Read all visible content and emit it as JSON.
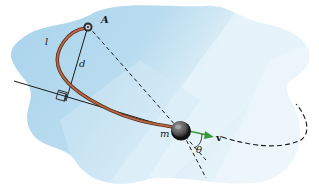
{
  "diagram": {
    "type": "physics-illustration",
    "labels": {
      "pivot": "A",
      "cord_length": "l",
      "perpendicular_distance": "d",
      "mass": "m",
      "velocity": "v",
      "angle": "θ"
    },
    "colors": {
      "surface_light": "#e3f1f8",
      "surface_mid": "#b9dcef",
      "surface_dark": "#8ec5e4",
      "cord": "#8b4a32",
      "velocity_arrow": "#3a9a3a",
      "lines": "#1a1a1a"
    }
  }
}
